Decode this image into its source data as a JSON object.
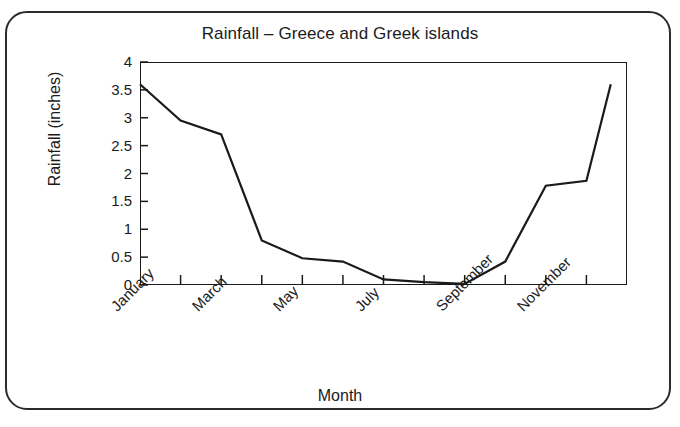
{
  "chart_data": {
    "type": "line",
    "title": "Rainfall – Greece and Greek islands",
    "xlabel": "Month",
    "ylabel": "Rainfall (inches)",
    "categories": [
      "January",
      "February",
      "March",
      "April",
      "May",
      "June",
      "July",
      "August",
      "September",
      "October",
      "November",
      "December"
    ],
    "x_tick_labels": [
      "January",
      "March",
      "May",
      "July",
      "September",
      "November"
    ],
    "x_tick_label_indices": [
      0,
      2,
      4,
      6,
      8,
      10
    ],
    "values": [
      3.6,
      2.95,
      2.7,
      0.8,
      0.48,
      0.42,
      0.1,
      0.05,
      0.02,
      0.42,
      1.78,
      1.87
    ],
    "extra_point_value": 3.6,
    "ylim": [
      0,
      4
    ],
    "y_ticks": [
      0,
      0.5,
      1,
      1.5,
      2,
      2.5,
      3,
      3.5,
      4
    ],
    "y_tick_labels": [
      "0",
      "0.5",
      "1",
      "1.5",
      "2",
      "2.5",
      "3",
      "3.5",
      "4"
    ],
    "grid": false,
    "legend": "none",
    "line_color": "#1a1a1a",
    "background_color": "#ffffff",
    "frame_color": "#2b2b2b"
  }
}
